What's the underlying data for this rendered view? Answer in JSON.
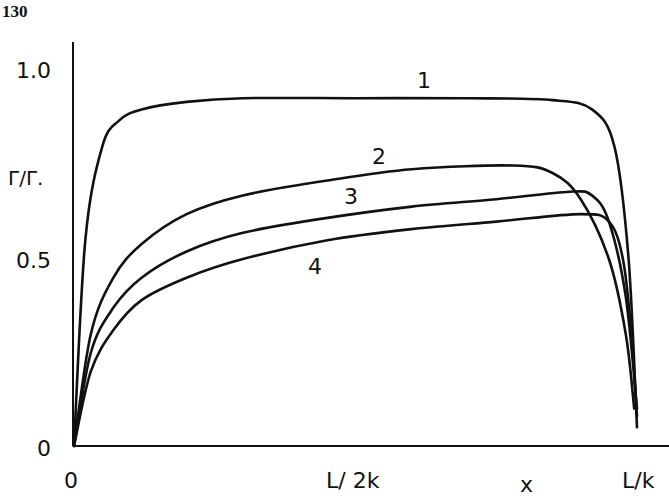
{
  "page": {
    "number": "130"
  },
  "chart_data": {
    "type": "line",
    "title": "",
    "xlabel": "x",
    "ylabel": "Γ/Γ.",
    "xlim": [
      0,
      1
    ],
    "ylim": [
      0,
      1.1
    ],
    "x_ticks": [
      {
        "value": 0,
        "label": "0"
      },
      {
        "value": 0.5,
        "label": "L/ 2k"
      },
      {
        "value": 1,
        "label": "L/k"
      }
    ],
    "y_ticks": [
      {
        "value": 0,
        "label": "0"
      },
      {
        "value": 0.5,
        "label": "0.5"
      },
      {
        "value": 1.0,
        "label": "1.0"
      }
    ],
    "x_units_note": "x in units of L/k",
    "grid": false,
    "legend": "inline numeric labels on curves",
    "series": [
      {
        "name": "1",
        "x": [
          0,
          0.02,
          0.05,
          0.08,
          0.12,
          0.2,
          0.3,
          0.5,
          0.7,
          0.85,
          0.92,
          0.96,
          0.985,
          1.0
        ],
        "y": [
          0,
          0.55,
          0.8,
          0.87,
          0.9,
          0.92,
          0.93,
          0.93,
          0.93,
          0.925,
          0.9,
          0.8,
          0.5,
          0.05
        ]
      },
      {
        "name": "2",
        "x": [
          0,
          0.03,
          0.07,
          0.12,
          0.2,
          0.3,
          0.45,
          0.6,
          0.78,
          0.85,
          0.9,
          0.95,
          0.98,
          0.995
        ],
        "y": [
          0,
          0.3,
          0.45,
          0.54,
          0.62,
          0.67,
          0.71,
          0.74,
          0.75,
          0.73,
          0.66,
          0.5,
          0.3,
          0.1
        ]
      },
      {
        "name": "3",
        "x": [
          0,
          0.03,
          0.07,
          0.12,
          0.2,
          0.3,
          0.45,
          0.6,
          0.75,
          0.88,
          0.92,
          0.95,
          0.98,
          1.0
        ],
        "y": [
          0,
          0.25,
          0.37,
          0.45,
          0.52,
          0.57,
          0.61,
          0.64,
          0.66,
          0.68,
          0.67,
          0.6,
          0.4,
          0.1
        ]
      },
      {
        "name": "4",
        "x": [
          0,
          0.03,
          0.07,
          0.12,
          0.2,
          0.3,
          0.45,
          0.6,
          0.75,
          0.9,
          0.95,
          0.975,
          0.99,
          1.0
        ],
        "y": [
          0,
          0.2,
          0.31,
          0.39,
          0.45,
          0.5,
          0.55,
          0.58,
          0.6,
          0.62,
          0.6,
          0.5,
          0.3,
          0.08
        ]
      }
    ],
    "annotations": [
      {
        "text": "1",
        "series": "1"
      },
      {
        "text": "2",
        "series": "2"
      },
      {
        "text": "3",
        "series": "3"
      },
      {
        "text": "4",
        "series": "4"
      }
    ]
  }
}
